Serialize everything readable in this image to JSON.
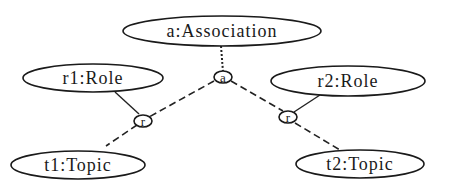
{
  "diagram": {
    "nodes": {
      "association": {
        "label": "a:Association"
      },
      "role1": {
        "label": "r1:Role"
      },
      "role2": {
        "label": "r2:Role"
      },
      "topic1": {
        "label": "t1:Topic"
      },
      "topic2": {
        "label": "t2:Topic"
      },
      "assoc_junction": {
        "label": "a"
      },
      "role_junction_left": {
        "label": "r"
      },
      "role_junction_right": {
        "label": "r"
      }
    },
    "edges": [
      {
        "from": "association",
        "to": "assoc_junction",
        "style": "dotted"
      },
      {
        "from": "assoc_junction",
        "to": "role_junction_left",
        "style": "dashed"
      },
      {
        "from": "role_junction_left",
        "to": "topic1",
        "style": "dashed"
      },
      {
        "from": "role1",
        "to": "role_junction_left",
        "style": "solid"
      },
      {
        "from": "assoc_junction",
        "to": "role_junction_right",
        "style": "dashed"
      },
      {
        "from": "role_junction_right",
        "to": "topic2",
        "style": "dashed"
      },
      {
        "from": "role2",
        "to": "role_junction_right",
        "style": "solid"
      }
    ],
    "colors": {
      "stroke": "#1a1a1a",
      "background": "#ffffff"
    }
  }
}
